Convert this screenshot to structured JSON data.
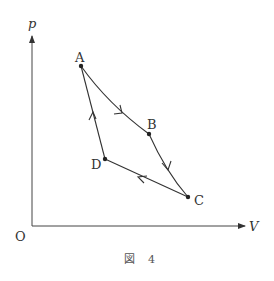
{
  "diagram": {
    "type": "p-V cycle diagram",
    "axes": {
      "y_label": "p",
      "x_label": "V",
      "origin_label": "O"
    },
    "points": [
      {
        "name": "A",
        "x": 81,
        "y": 66
      },
      {
        "name": "B",
        "x": 149,
        "y": 134
      },
      {
        "name": "C",
        "x": 188,
        "y": 197
      },
      {
        "name": "D",
        "x": 105,
        "y": 159
      }
    ],
    "processes": [
      {
        "from": "A",
        "to": "B",
        "shape": "curve"
      },
      {
        "from": "B",
        "to": "C",
        "shape": "curve"
      },
      {
        "from": "C",
        "to": "D",
        "shape": "line"
      },
      {
        "from": "D",
        "to": "A",
        "shape": "line"
      }
    ],
    "caption": {
      "figure_char": "図",
      "number": "4"
    },
    "colors": {
      "line": "#333333",
      "background": "#ffffff"
    }
  }
}
